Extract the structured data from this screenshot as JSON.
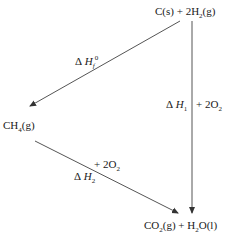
{
  "diagram": {
    "type": "thermochemical-cycle",
    "nodes": {
      "reactants": {
        "formula": "C(s) + 2H",
        "sub": "2",
        "suffix": "(g)"
      },
      "intermediate": {
        "formula": "CH",
        "sub": "4",
        "suffix": "(g)"
      },
      "products": {
        "part1": "CO",
        "sub1": "2",
        "part2": "(g) + H",
        "sub2": "2",
        "part3": "O(l)"
      }
    },
    "edges": {
      "formation": {
        "delta": "Δ",
        "symbol": "H",
        "sub": "f",
        "sup": "0",
        "from": "reactants",
        "to": "intermediate"
      },
      "direct": {
        "delta": "Δ",
        "symbol": "H",
        "sub": "1",
        "reagent": "+ 2O",
        "reagent_sub": "2",
        "from": "reactants",
        "to": "products"
      },
      "combustion": {
        "delta": "Δ",
        "symbol": "H",
        "sub": "2",
        "reagent": "+ 2O",
        "reagent_sub": "2",
        "from": "intermediate",
        "to": "products"
      }
    },
    "colors": {
      "line": "#555555",
      "text": "#1a1a1a"
    }
  }
}
